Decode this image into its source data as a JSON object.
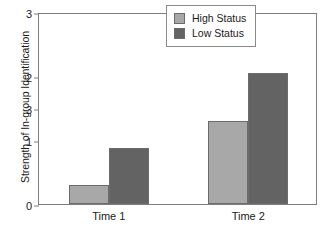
{
  "chart_data": {
    "type": "bar",
    "title": "",
    "xlabel": "",
    "ylabel": "Strength of In-group Identification",
    "categories": [
      "Time 1",
      "Time 2"
    ],
    "series": [
      {
        "name": "High Status",
        "color": "#a8a8a8",
        "values": [
          0.3,
          1.3
        ]
      },
      {
        "name": "Low Status",
        "color": "#636363",
        "values": [
          0.88,
          2.05
        ]
      }
    ],
    "ylim": [
      0,
      3
    ],
    "y_tick_values": [
      3,
      2,
      1.5,
      1,
      0
    ],
    "y_tick_labels": [
      "3",
      "2",
      "3",
      "1",
      "0"
    ],
    "grid": false,
    "legend_position": "top-right",
    "annotations": []
  },
  "axis": {
    "y_title": "Strength of In-group Identification"
  },
  "legend": {
    "entries": [
      {
        "label": "High Status",
        "color": "#a8a8a8"
      },
      {
        "label": "Low Status",
        "color": "#636363"
      }
    ]
  },
  "ticks": {
    "y": [
      {
        "label": "3",
        "value": 3
      },
      {
        "label": "2",
        "value": 2
      },
      {
        "label": "3",
        "value": 1.5
      },
      {
        "label": "1",
        "value": 1
      },
      {
        "label": "0",
        "value": 0
      }
    ]
  },
  "categories": [
    {
      "label": "Time 1"
    },
    {
      "label": "Time 2"
    }
  ]
}
